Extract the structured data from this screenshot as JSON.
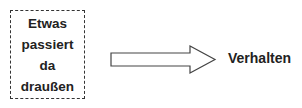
{
  "diagram": {
    "source_box": {
      "lines": [
        "Etwas",
        "passiert",
        "da",
        "draußen"
      ],
      "border_style": "dashed",
      "border_color": "#333333"
    },
    "arrow": {
      "direction": "right",
      "style": "outlined block arrow",
      "stroke_color": "#444444"
    },
    "target_label": "Verhalten"
  }
}
